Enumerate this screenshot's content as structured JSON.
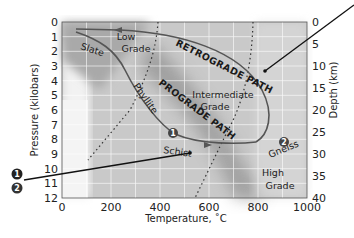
{
  "diagram": {
    "xaxis": {
      "label": "Temperature, ˚C",
      "ticks": [
        "0",
        "200",
        "400",
        "600",
        "800",
        "1000"
      ],
      "range": [
        0,
        1000
      ]
    },
    "yaxis_left": {
      "label": "Pressure (kilobars)",
      "ticks": [
        "0",
        "1",
        "2",
        "3",
        "4",
        "5",
        "6",
        "7",
        "8",
        "9",
        "10",
        "11",
        "12"
      ],
      "range": [
        0,
        12
      ]
    },
    "yaxis_right": {
      "label": "Depth (km)",
      "ticks": [
        "0",
        "5",
        "10",
        "15",
        "20",
        "25",
        "30",
        "35",
        "40"
      ],
      "range": [
        0,
        40
      ]
    },
    "zones": {
      "low": [
        "Low",
        "Grade"
      ],
      "intermediate": [
        "Intermediate",
        "Grade"
      ],
      "high": [
        "High",
        "Grade"
      ]
    },
    "rocks": {
      "slate": "Slate",
      "phyllite": "Phyllite",
      "schist": "Schist",
      "gneiss": "Gneiss"
    },
    "paths": {
      "retrograde": "RETROGRADE PATH",
      "prograde": "PROGRADE PATH"
    },
    "markers": [
      {
        "num": "1",
        "temp": 525,
        "pressure": 8.5
      },
      {
        "num": "2",
        "temp": 920,
        "pressure": 8.8
      }
    ],
    "callouts": [
      "1",
      "2"
    ],
    "colors": {
      "path": "#555555",
      "marker": "#444444",
      "callout": "#111111"
    }
  }
}
